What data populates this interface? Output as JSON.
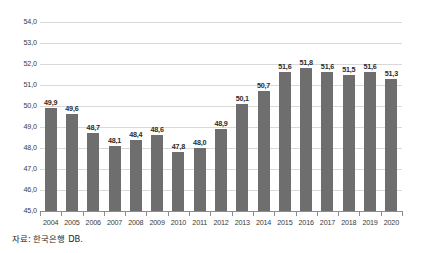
{
  "chart_data": {
    "type": "bar",
    "title": "",
    "xlabel": "",
    "ylabel": "",
    "ylim": [
      45.0,
      54.0
    ],
    "ytick_step": 1.0,
    "ytick_labels": [
      "54,0",
      "53,0",
      "52,0",
      "51,0",
      "50,0",
      "49,0",
      "48,0",
      "47,0",
      "46,0",
      "45,0"
    ],
    "ytick_values": [
      54.0,
      53.0,
      52.0,
      51.0,
      50.0,
      49.0,
      48.0,
      47.0,
      46.0,
      45.0
    ],
    "grid": true,
    "legend": "none",
    "decimal_separator": ",",
    "categories": [
      "2004",
      "2005",
      "2006",
      "2007",
      "2008",
      "2009",
      "2010",
      "2011",
      "2012",
      "2013",
      "2014",
      "2015",
      "2016",
      "2017",
      "2018",
      "2019",
      "2020"
    ],
    "values": [
      49.9,
      49.6,
      48.7,
      48.1,
      48.4,
      48.6,
      47.8,
      48.0,
      48.9,
      50.1,
      50.7,
      51.6,
      51.8,
      51.6,
      51.5,
      51.6,
      51.3
    ],
    "data_labels": [
      "49,9",
      "49,6",
      "48,7",
      "48,1",
      "48,4",
      "48,6",
      "47,8",
      "48,0",
      "48,9",
      "50,1",
      "50,7",
      "51,6",
      "51,8",
      "51,6",
      "51,5",
      "51,6",
      "51,3"
    ],
    "bar_color": "#6e6e6e",
    "gridline_color": "#d9d9d9",
    "axis_color": "#8c8c8c"
  },
  "footer": {
    "source_note": "자료: 한국은행 DB."
  }
}
